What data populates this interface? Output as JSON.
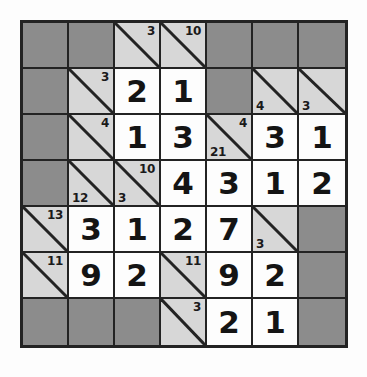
{
  "puzzle": {
    "type": "kakuro",
    "rows": 7,
    "cols": 7,
    "colors": {
      "page_background": "#fdfdfd",
      "blocked_cell": "#8c8c8c",
      "clue_cell": "#d7d7d7",
      "entry_cell": "#fdfdfd",
      "grid_line": "#232323",
      "digit_color": "#141414",
      "clue_text_color": "#1a1a1a"
    },
    "cells": [
      [
        {
          "kind": "block"
        },
        {
          "kind": "block"
        },
        {
          "kind": "clue",
          "down": "3"
        },
        {
          "kind": "clue",
          "down": "10"
        },
        {
          "kind": "block"
        },
        {
          "kind": "block"
        },
        {
          "kind": "block"
        }
      ],
      [
        {
          "kind": "block"
        },
        {
          "kind": "clue",
          "down": "3"
        },
        {
          "kind": "entry",
          "value": "2"
        },
        {
          "kind": "entry",
          "value": "1"
        },
        {
          "kind": "block"
        },
        {
          "kind": "clue",
          "across": "4"
        },
        {
          "kind": "clue",
          "across": "3"
        }
      ],
      [
        {
          "kind": "block"
        },
        {
          "kind": "clue",
          "down": "4"
        },
        {
          "kind": "entry",
          "value": "1"
        },
        {
          "kind": "entry",
          "value": "3"
        },
        {
          "kind": "clue",
          "across": "21",
          "down": "4"
        },
        {
          "kind": "entry",
          "value": "3"
        },
        {
          "kind": "entry",
          "value": "1"
        }
      ],
      [
        {
          "kind": "block"
        },
        {
          "kind": "clue",
          "across": "12"
        },
        {
          "kind": "clue",
          "across": "3",
          "down": "10"
        },
        {
          "kind": "entry",
          "value": "4"
        },
        {
          "kind": "entry",
          "value": "3"
        },
        {
          "kind": "entry",
          "value": "1"
        },
        {
          "kind": "entry",
          "value": "2"
        }
      ],
      [
        {
          "kind": "clue",
          "down": "13"
        },
        {
          "kind": "entry",
          "value": "3"
        },
        {
          "kind": "entry",
          "value": "1"
        },
        {
          "kind": "entry",
          "value": "2"
        },
        {
          "kind": "entry",
          "value": "7"
        },
        {
          "kind": "clue",
          "across": "3"
        },
        {
          "kind": "block"
        }
      ],
      [
        {
          "kind": "clue",
          "down": "11"
        },
        {
          "kind": "entry",
          "value": "9"
        },
        {
          "kind": "entry",
          "value": "2"
        },
        {
          "kind": "clue",
          "down": "11"
        },
        {
          "kind": "entry",
          "value": "9"
        },
        {
          "kind": "entry",
          "value": "2"
        },
        {
          "kind": "block"
        }
      ],
      [
        {
          "kind": "block"
        },
        {
          "kind": "block"
        },
        {
          "kind": "block"
        },
        {
          "kind": "clue",
          "down": "3"
        },
        {
          "kind": "entry",
          "value": "2"
        },
        {
          "kind": "entry",
          "value": "1"
        },
        {
          "kind": "block"
        }
      ]
    ]
  }
}
